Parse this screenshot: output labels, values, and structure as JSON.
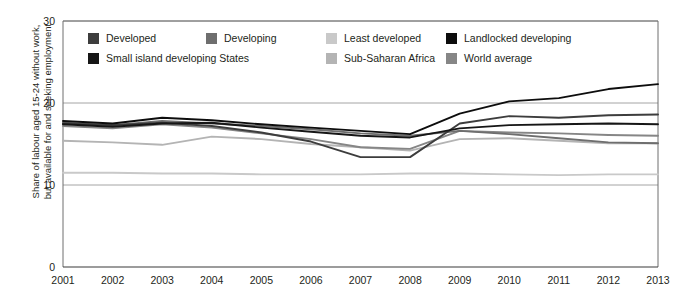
{
  "chart_data": {
    "type": "line",
    "title": "",
    "xlabel": "",
    "ylabel": "Share of labour aged 15-24 without work,\nbut available for and seeking employment",
    "x": [
      2001,
      2002,
      2003,
      2004,
      2005,
      2006,
      2007,
      2008,
      2009,
      2010,
      2011,
      2012,
      2013
    ],
    "categories": [
      "2001",
      "2002",
      "2003",
      "2004",
      "2005",
      "2006",
      "2007",
      "2008",
      "2009",
      "2010",
      "2011",
      "2012",
      "2013"
    ],
    "ylim": [
      0,
      30
    ],
    "xlim": [
      2001,
      2013
    ],
    "yticks": [
      0,
      10,
      20,
      30
    ],
    "grid": true,
    "legend_position": "top-inside",
    "series": [
      {
        "name": "Developed",
        "color": "#3d3d3d",
        "values": [
          17.5,
          17.3,
          17.6,
          17.2,
          16.4,
          15.3,
          13.4,
          13.4,
          17.5,
          18.4,
          18.2,
          18.5,
          18.6
        ]
      },
      {
        "name": "Developing",
        "color": "#6e6e6e",
        "values": [
          17.6,
          17.3,
          17.8,
          17.5,
          17.2,
          16.8,
          16.3,
          16.0,
          16.6,
          16.2,
          15.7,
          15.2,
          15.1
        ]
      },
      {
        "name": "Least developed",
        "color": "#c9c9c9",
        "values": [
          11.5,
          11.5,
          11.4,
          11.4,
          11.3,
          11.3,
          11.3,
          11.4,
          11.4,
          11.3,
          11.2,
          11.3,
          11.3
        ]
      },
      {
        "name": "Landlocked developing",
        "color": "#0d0d0d",
        "values": [
          17.8,
          17.5,
          18.2,
          17.9,
          17.4,
          17.0,
          16.6,
          16.2,
          18.7,
          20.2,
          20.6,
          21.7,
          22.3
        ]
      },
      {
        "name": "Small island developing States",
        "color": "#161616",
        "values": [
          17.4,
          17.1,
          17.5,
          17.6,
          17.0,
          16.5,
          16.0,
          15.8,
          16.9,
          17.3,
          17.4,
          17.5,
          17.4
        ]
      },
      {
        "name": "Sub-Saharan Africa",
        "color": "#b4b4b4",
        "values": [
          15.4,
          15.2,
          14.9,
          15.9,
          15.6,
          15.0,
          14.6,
          14.2,
          15.6,
          15.7,
          15.4,
          15.1,
          15.1
        ]
      },
      {
        "name": "World average",
        "color": "#868686",
        "values": [
          17.2,
          16.9,
          17.4,
          17.0,
          16.3,
          15.6,
          14.6,
          14.4,
          16.6,
          16.4,
          16.3,
          16.1,
          16.0
        ]
      }
    ]
  },
  "axes": {
    "yticks": [
      "30",
      "20",
      "10",
      "0"
    ],
    "xticks": [
      "2001",
      "2002",
      "2003",
      "2004",
      "2005",
      "2006",
      "2007",
      "2008",
      "2009",
      "2010",
      "2011",
      "2012",
      "2013"
    ],
    "ylabel_line1": "Share of labour aged 15-24 without work,",
    "ylabel_line2": "but available for and seeking employment"
  },
  "legend": {
    "row1": [
      {
        "label": "Developed",
        "color": "#3d3d3d"
      },
      {
        "label": "Developing",
        "color": "#6e6e6e"
      },
      {
        "label": "Least developed",
        "color": "#c9c9c9"
      },
      {
        "label": "Landlocked developing",
        "color": "#0d0d0d"
      }
    ],
    "row2": [
      {
        "label": "Small island developing States",
        "color": "#161616"
      },
      {
        "label": "Sub-Saharan Africa",
        "color": "#b4b4b4"
      },
      {
        "label": "World average",
        "color": "#868686"
      }
    ]
  }
}
